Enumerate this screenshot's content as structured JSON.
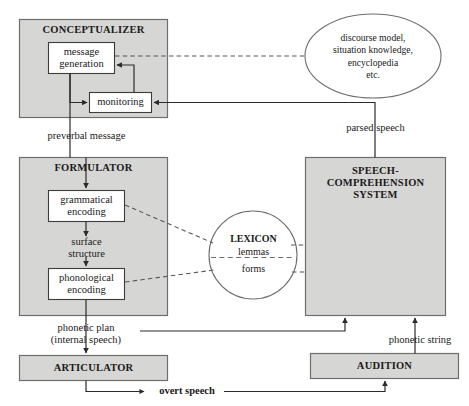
{
  "diagram": {
    "colors": {
      "module_fill": "#d6d6d4",
      "inner_fill": "#ffffff",
      "stroke": "#6e6e6e",
      "inner_stroke": "#3c3c3c",
      "text": "#1a1a1a",
      "background": "#ffffff"
    },
    "modules": [
      {
        "id": "conceptualizer",
        "label": "CONCEPTUALIZER"
      },
      {
        "id": "formulator",
        "label": "FORMULATOR"
      },
      {
        "id": "speech_comprehension",
        "label": "SPEECH-\nCOMPREHENSION\nSYSTEM"
      },
      {
        "id": "articulator",
        "label": "ARTICULATOR"
      },
      {
        "id": "audition",
        "label": "AUDITION"
      }
    ],
    "inner_boxes": [
      {
        "id": "message_generation",
        "label": "message\ngeneration"
      },
      {
        "id": "monitoring",
        "label": "monitoring"
      },
      {
        "id": "grammatical_encoding",
        "label": "grammatical\nencoding"
      },
      {
        "id": "phonological_encoding",
        "label": "phonological\nencoding"
      }
    ],
    "ellipses": [
      {
        "id": "knowledge_store",
        "label": "discourse model,\nsituation knowledge,\nencyclopedia\netc."
      },
      {
        "id": "lexicon",
        "title": "LEXICON",
        "upper": "lemmas",
        "lower": "forms"
      }
    ],
    "edge_labels": [
      {
        "id": "preverbal_message",
        "label": "preverbal message"
      },
      {
        "id": "parsed_speech",
        "label": "parsed speech"
      },
      {
        "id": "surface_structure",
        "label": "surface\nstructure"
      },
      {
        "id": "phonetic_plan",
        "label": "phonetic plan\n(internal speech)"
      },
      {
        "id": "phonetic_string",
        "label": "phonetic string"
      },
      {
        "id": "overt_speech",
        "label": "overt speech"
      }
    ]
  }
}
